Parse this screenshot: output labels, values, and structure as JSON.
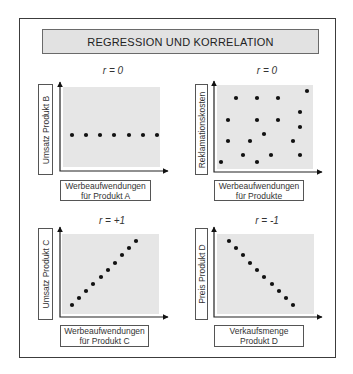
{
  "title": "REGRESSION UND KORRELATION",
  "colors": {
    "frame": "#3c3c3c",
    "title_fill": "#e2e2e2",
    "plot_fill": "#e6e6e6",
    "dot": "#111111"
  },
  "panels": [
    {
      "id": "A",
      "r_label": "r = 0",
      "y_label": "Umsatz Produkt B",
      "x_label_line1": "Werbeaufwendungen",
      "x_label_line2": "für Produkt A"
    },
    {
      "id": "B",
      "r_label": "r = 0",
      "y_label": "Reklamationskosten",
      "x_label_line1": "Werbeaufwendungen",
      "x_label_line2": "für Produkte"
    },
    {
      "id": "C",
      "r_label": "r = +1",
      "y_label": "Umsatz Produkt C",
      "x_label_line1": "Werbeaufwendungen",
      "x_label_line2": "für Produkt C"
    },
    {
      "id": "D",
      "r_label": "r = -1",
      "y_label": "Preis Produkt D",
      "x_label_line1": "Verkaufsmenge",
      "x_label_line2": "Produkt D"
    }
  ],
  "chart_data": [
    {
      "type": "scatter",
      "title": "r = 0",
      "xlabel": "Werbeaufwendungen für Produkt A",
      "ylabel": "Umsatz Produkt B",
      "grid": false,
      "points_px": [
        [
          72,
          135
        ],
        [
          86,
          135
        ],
        [
          100,
          135
        ],
        [
          114,
          135
        ],
        [
          129,
          135
        ],
        [
          143,
          135
        ],
        [
          157,
          135
        ]
      ]
    },
    {
      "type": "scatter",
      "title": "r = 0",
      "xlabel": "Werbeaufwendungen für Produkte",
      "ylabel": "Reklamationskosten",
      "grid": false,
      "points_px": [
        [
          307,
          91
        ],
        [
          236,
          98
        ],
        [
          257,
          98
        ],
        [
          278,
          98
        ],
        [
          300,
          112
        ],
        [
          228,
          120
        ],
        [
          257,
          120
        ],
        [
          278,
          120
        ],
        [
          300,
          127
        ],
        [
          264,
          134
        ],
        [
          228,
          141
        ],
        [
          250,
          141
        ],
        [
          293,
          141
        ],
        [
          243,
          155
        ],
        [
          271,
          155
        ],
        [
          300,
          155
        ],
        [
          221,
          162
        ],
        [
          257,
          162
        ]
      ]
    },
    {
      "type": "scatter",
      "title": "r = +1",
      "xlabel": "Werbeaufwendungen für Produkt C",
      "ylabel": "Umsatz Produkt C",
      "grid": false,
      "points_px": [
        [
          72,
          305
        ],
        [
          79,
          298
        ],
        [
          86,
          291
        ],
        [
          93,
          284
        ],
        [
          101,
          277
        ],
        [
          108,
          270
        ],
        [
          115,
          263
        ],
        [
          122,
          255
        ],
        [
          129,
          248
        ],
        [
          136,
          241
        ]
      ]
    },
    {
      "type": "scatter",
      "title": "r = -1",
      "xlabel": "Verkaufsmenge Produkt D",
      "ylabel": "Preis Produkt D",
      "grid": false,
      "points_px": [
        [
          229,
          241
        ],
        [
          236,
          248
        ],
        [
          243,
          255
        ],
        [
          250,
          263
        ],
        [
          257,
          270
        ],
        [
          264,
          277
        ],
        [
          272,
          284
        ],
        [
          279,
          291
        ],
        [
          286,
          298
        ],
        [
          293,
          305
        ]
      ]
    }
  ]
}
